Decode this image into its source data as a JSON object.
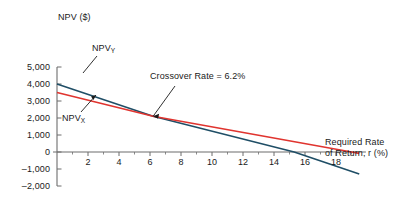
{
  "chart_data": {
    "type": "line",
    "title": "",
    "ylabel": "NPV ($)",
    "xlabel": "Required Rate of Return, r (%)",
    "xlabel_line1": "Required Rate",
    "xlabel_line2": "of Return, r (%)",
    "xlim": [
      0,
      19.8
    ],
    "ylim": [
      -2000,
      5000
    ],
    "grid": false,
    "legend_position": "inline-annotations",
    "xticks": [
      2,
      4,
      6,
      8,
      10,
      12,
      14,
      16,
      18
    ],
    "xticklabels": [
      "2",
      "4",
      "6",
      "8",
      "10",
      "12",
      "14",
      "16",
      "18"
    ],
    "xminorticks": [
      1,
      3,
      5,
      7,
      9,
      11,
      13,
      15,
      17,
      19
    ],
    "yticks": [
      5000,
      4000,
      3000,
      2000,
      1000,
      0,
      -1000,
      -2000
    ],
    "yticklabels": [
      "5,000",
      "4,000",
      "3,000",
      "2,000",
      "1,000",
      "0",
      "–1,000",
      "–2,000"
    ],
    "series": [
      {
        "name": "NPV_Y",
        "label_text": "NPV",
        "label_sub": "Y",
        "color": "#1f4e66",
        "x": [
          0,
          6.2,
          15.3,
          19.5
        ],
        "y": [
          4000,
          2100,
          0,
          -1300
        ]
      },
      {
        "name": "NPV_X",
        "label_text": "NPV",
        "label_sub": "X",
        "color": "#e0342f",
        "x": [
          0,
          6.2,
          19.0,
          19.5
        ],
        "y": [
          3500,
          2100,
          0,
          -80
        ]
      }
    ],
    "annotations": [
      {
        "name": "crossover-rate",
        "text": "Crossover Rate = 6.2%",
        "x": 6.2,
        "y": 2100,
        "rate": 6.2
      },
      {
        "name": "npv-y-label",
        "text": "NPV",
        "sub": "Y"
      },
      {
        "name": "npv-x-label",
        "text": "NPV",
        "sub": "X"
      }
    ]
  },
  "axes": {
    "y_title": "NPV ($)",
    "x_title_line1": "Required Rate",
    "x_title_line2": "of Return, r (%)"
  },
  "ytick_labels": {
    "t0": "5,000",
    "t1": "4,000",
    "t2": "3,000",
    "t3": "2,000",
    "t4": "1,000",
    "t5": "0",
    "t6": "–1,000",
    "t7": "–2,000"
  },
  "xtick_labels": {
    "t0": "2",
    "t1": "4",
    "t2": "6",
    "t3": "8",
    "t4": "10",
    "t5": "12",
    "t6": "14",
    "t7": "16",
    "t8": "18"
  },
  "annotations": {
    "crossover": "Crossover Rate = 6.2%",
    "npv_y_main": "NPV",
    "npv_y_sub": "Y",
    "npv_x_main": "NPV",
    "npv_x_sub": "X"
  },
  "colors": {
    "series_y": "#1f4e66",
    "series_x": "#e0342f",
    "axis": "#6d6d6d",
    "text": "#1a1a1a",
    "background": "#ffffff"
  }
}
